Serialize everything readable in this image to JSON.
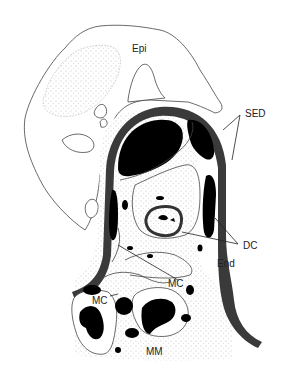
{
  "figure": {
    "type": "anatomical-diagram",
    "colors": {
      "background": "#ffffff",
      "outline": "#444444",
      "dense_fill": "#000000",
      "sed_band": "#3a3a3a",
      "stipple": "#888888"
    },
    "labels": {
      "epi": "Epi",
      "sed": "SED",
      "dc": "DC",
      "end": "End",
      "mc_right": "MC",
      "mc_left": "MC",
      "mm": "MM"
    }
  }
}
